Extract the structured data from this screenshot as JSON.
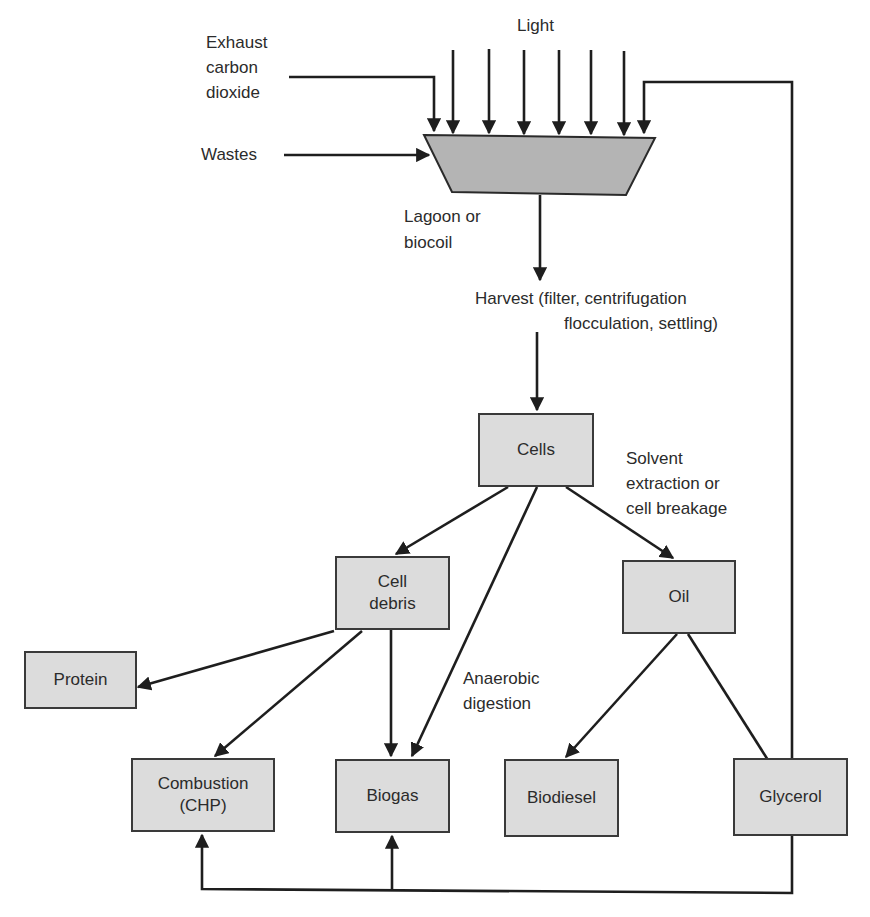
{
  "diagram": {
    "title": "",
    "inputs": {
      "light": "Light",
      "exhaust": [
        "Exhaust",
        "carbon",
        "dioxide"
      ],
      "wastes": "Wastes"
    },
    "reactor": {
      "label": [
        "Lagoon or",
        "biocoil"
      ]
    },
    "harvest": {
      "line1": "Harvest (filter, centrifugation",
      "line2": "flocculation, settling)"
    },
    "nodes": {
      "cells": "Cells",
      "cell_debris": [
        "Cell",
        "debris"
      ],
      "oil": "Oil",
      "protein": "Protein",
      "combustion": [
        "Combustion",
        "(CHP)"
      ],
      "biogas": "Biogas",
      "biodiesel": "Biodiesel",
      "glycerol": "Glycerol"
    },
    "edge_labels": {
      "solvent": [
        "Solvent",
        "extraction or",
        "cell breakage"
      ],
      "anaerobic": [
        "Anaerobic",
        "digestion"
      ]
    },
    "edges": [
      {
        "from": "light",
        "to": "reactor"
      },
      {
        "from": "exhaust",
        "to": "reactor"
      },
      {
        "from": "wastes",
        "to": "reactor"
      },
      {
        "from": "glycerol",
        "to": "reactor"
      },
      {
        "from": "reactor",
        "to": "harvest"
      },
      {
        "from": "harvest",
        "to": "cells"
      },
      {
        "from": "cells",
        "to": "cell_debris"
      },
      {
        "from": "cells",
        "to": "biogas",
        "label": "Anaerobic digestion"
      },
      {
        "from": "cells",
        "to": "oil",
        "label": "Solvent extraction or cell breakage"
      },
      {
        "from": "cell_debris",
        "to": "protein"
      },
      {
        "from": "cell_debris",
        "to": "combustion"
      },
      {
        "from": "cell_debris",
        "to": "biogas"
      },
      {
        "from": "oil",
        "to": "biodiesel"
      },
      {
        "from": "oil",
        "to": "glycerol"
      },
      {
        "from": "glycerol",
        "to": "combustion"
      },
      {
        "from": "glycerol",
        "to": "biogas"
      }
    ],
    "colors": {
      "box_fill": "#dcdcdc",
      "reactor_fill": "#b4b4b4",
      "line": "#1e1e1e"
    }
  }
}
